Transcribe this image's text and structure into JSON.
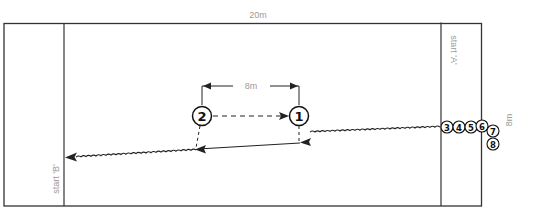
{
  "diagram": {
    "type": "drill-field",
    "field": {
      "width_label": "20m",
      "height_label": "8m",
      "start_a_label": "start 'A'",
      "start_b_label": "start 'B'"
    },
    "dimension": {
      "between_players_label": "8m"
    },
    "players": [
      {
        "id": "1",
        "label": "1",
        "x": 299,
        "y": 116,
        "r": 9.5,
        "size": 13
      },
      {
        "id": "2",
        "label": "2",
        "x": 202,
        "y": 116,
        "r": 9.5,
        "size": 13
      },
      {
        "id": "3",
        "label": "3",
        "x": 447,
        "y": 127,
        "r": 6,
        "size": 9
      },
      {
        "id": "4",
        "label": "4",
        "x": 459,
        "y": 127,
        "r": 6,
        "size": 9
      },
      {
        "id": "5",
        "label": "5",
        "x": 471,
        "y": 127,
        "r": 6,
        "size": 9
      },
      {
        "id": "6",
        "label": "6",
        "x": 482,
        "y": 126,
        "r": 6,
        "size": 9
      },
      {
        "id": "7",
        "label": "7",
        "x": 493,
        "y": 130,
        "r": 6,
        "size": 9
      },
      {
        "id": "8",
        "label": "8",
        "x": 493,
        "y": 144,
        "r": 6,
        "size": 9
      }
    ],
    "paths": [
      {
        "kind": "dribble",
        "from": "start A",
        "to": "player 1"
      },
      {
        "kind": "pass",
        "from": "player 2",
        "to": "player 1",
        "style": "dashed"
      },
      {
        "kind": "run",
        "from": "player 1",
        "to": "player 2 position",
        "style": "solid"
      },
      {
        "kind": "dribble",
        "from": "player 2 position",
        "to": "start B"
      }
    ],
    "colors": {
      "line": "#222222",
      "label": "#9a9a9a",
      "background": "#ffffff"
    }
  }
}
